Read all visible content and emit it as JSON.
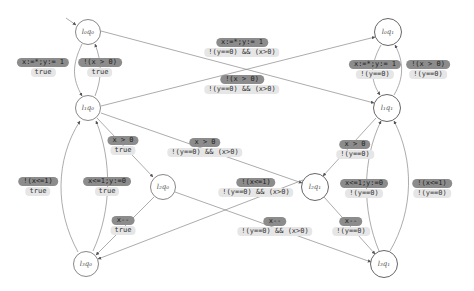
{
  "nodes": [
    {
      "id": "l0q0",
      "label": "l₀q₀",
      "x": 88,
      "y": 32,
      "kind": "q0"
    },
    {
      "id": "l1q0",
      "label": "l₁q₀",
      "x": 88,
      "y": 108,
      "kind": "q0"
    },
    {
      "id": "l2q0",
      "label": "l₂q₀",
      "x": 163,
      "y": 187,
      "kind": "q0"
    },
    {
      "id": "l3q0",
      "label": "l₃q₀",
      "x": 86,
      "y": 264,
      "kind": "q0"
    },
    {
      "id": "l0q1",
      "label": "l₀q₁",
      "x": 388,
      "y": 32,
      "kind": "q1"
    },
    {
      "id": "l1q1",
      "label": "l₁q₁",
      "x": 387,
      "y": 108,
      "kind": "q1"
    },
    {
      "id": "l2q1",
      "label": "l₂q₁",
      "x": 315,
      "y": 187,
      "kind": "q1"
    },
    {
      "id": "l3q1",
      "label": "l₃q₁",
      "x": 384,
      "y": 264,
      "kind": "q1"
    }
  ],
  "labels": [
    {
      "action": "x:=*;y:= 1",
      "guard": "true",
      "x": 43,
      "y": 63
    },
    {
      "action": "!(x > 0)",
      "guard": "true",
      "x": 100,
      "y": 63
    },
    {
      "action": "x:=*;y:= 1",
      "guard": "!(y==0) && (x>0)",
      "x": 242,
      "y": 43
    },
    {
      "action": "!(x > 0)",
      "guard": "!(y==0) && (x>0)",
      "x": 242,
      "y": 77
    },
    {
      "action": "x:=*;y:= 1",
      "guard": "!(y==0)",
      "x": 375,
      "y": 63
    },
    {
      "action": "!(x > 0)",
      "guard": "!(y==0)",
      "x": 428,
      "y": 63
    },
    {
      "action": "x > 0",
      "guard": "true",
      "x": 123,
      "y": 139
    },
    {
      "action": "x > 0",
      "guard": "!(y==0) && (x>0)",
      "x": 203,
      "y": 139
    },
    {
      "action": "x > 0",
      "guard": "!(y==0)",
      "x": 352,
      "y": 139
    },
    {
      "action": "!(x<=1)",
      "guard": "true",
      "x": 38,
      "y": 179
    },
    {
      "action": "x<=1;y:=0",
      "guard": "true",
      "x": 107,
      "y": 179
    },
    {
      "action": "!(x<=1)",
      "guard": "!(y==0) && (x>0)",
      "x": 254,
      "y": 179
    },
    {
      "action": "x<=1;y:=0",
      "guard": "!(y==0)",
      "x": 365,
      "y": 179
    },
    {
      "action": "!(x<=1)",
      "guard": "!(y==0)",
      "x": 431,
      "y": 179
    },
    {
      "action": "x--",
      "guard": "true",
      "x": 123,
      "y": 218
    },
    {
      "action": "x--",
      "guard": "!(y==0) && (x>0)",
      "x": 274,
      "y": 218
    },
    {
      "action": "x--",
      "guard": "!(y==0)",
      "x": 351,
      "y": 218
    }
  ],
  "colors": {
    "edge": "#777777",
    "action_bg": "#8c8c8c",
    "guard_bg": "#e6e6e6"
  }
}
